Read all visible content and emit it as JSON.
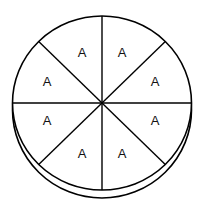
{
  "diagram": {
    "type": "divided-circle",
    "sectors": 8,
    "labels": [
      "A",
      "A",
      "A",
      "A",
      "A",
      "A",
      "A",
      "A"
    ],
    "stroke_color": "#000000",
    "fill_color": "#ffffff",
    "has_depth_rim": true
  }
}
